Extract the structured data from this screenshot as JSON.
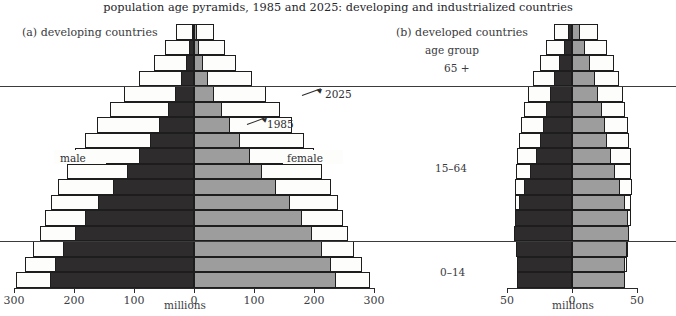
{
  "title": "population age pyramids, 1985 and 2025: developing and industrialized countries",
  "panels": {
    "left": {
      "label": "(a)  developing countries",
      "axis_caption": "millions",
      "ticks": [
        "300",
        "200",
        "100",
        "0",
        "100",
        "200",
        "300"
      ],
      "male_label": "male",
      "female_label": "female",
      "annotations": {
        "future": "2025",
        "past": "1985"
      }
    },
    "right": {
      "label": "(b)  developed countries",
      "age_group_caption": "age group",
      "axis_caption": "millions",
      "ticks": [
        "50",
        "0",
        "50"
      ],
      "age_groups": [
        "65 +",
        "15–64",
        "0–14"
      ]
    }
  },
  "colors": {
    "bar_1985_male": "#2e2c2d",
    "bar_1985_female": "#9d9d9d",
    "bar_2025_outline": "#fdfdfb",
    "ink": "#1d1d1d"
  },
  "chart_data": {
    "type": "bar",
    "title": "population age pyramids, 1985 and 2025: developing and industrialized countries",
    "xlabel": "millions",
    "ylabel": "age group",
    "grid": false,
    "legend_position": "in-plot annotations",
    "age_bands": [
      "80+",
      "75–79",
      "70–74",
      "65–69",
      "60–64",
      "55–59",
      "50–54",
      "45–49",
      "40–44",
      "35–39",
      "30–34",
      "25–29",
      "20–24",
      "15–19",
      "10–14",
      "5–9",
      "0–4"
    ],
    "age_group_dividers": [
      "65 +",
      "15–64",
      "0–14"
    ],
    "panels": [
      {
        "name": "developing countries",
        "xlim": [
          -300,
          300
        ],
        "xticks": [
          -300,
          -200,
          -100,
          0,
          100,
          200,
          300
        ],
        "series": [
          {
            "name": "male 1985",
            "side": "left",
            "year": 1985,
            "values": [
              4,
              8,
              14,
              22,
              32,
              44,
              58,
              74,
              92,
              112,
              135,
              160,
              182,
              198,
              218,
              232,
              240
            ]
          },
          {
            "name": "female 1985",
            "side": "right",
            "year": 1985,
            "values": [
              5,
              9,
              15,
              24,
              34,
              46,
              60,
              76,
              94,
              114,
              136,
              160,
              180,
              196,
              214,
              228,
              236
            ]
          },
          {
            "name": "male 2025",
            "side": "left",
            "year": 2025,
            "values": [
              30,
              48,
              66,
              92,
              116,
              140,
              162,
              182,
              198,
              212,
              226,
              238,
              248,
              256,
              268,
              282,
              296
            ]
          },
          {
            "name": "female 2025",
            "side": "right",
            "year": 2025,
            "values": [
              34,
              52,
              70,
              96,
              120,
              144,
              164,
              184,
              200,
              214,
              228,
              240,
              248,
              256,
              266,
              280,
              294
            ]
          }
        ]
      },
      {
        "name": "developed countries",
        "xlim": [
          -50,
          50
        ],
        "xticks": [
          -50,
          0,
          50
        ],
        "series": [
          {
            "name": "male 1985",
            "side": "left",
            "year": 1985,
            "values": [
              3,
              6,
              10,
              14,
              17,
              20,
              22,
              25,
              28,
              32,
              37,
              41,
              44,
              45,
              43,
              42,
              42
            ]
          },
          {
            "name": "female 1985",
            "side": "right",
            "year": 1985,
            "values": [
              6,
              10,
              14,
              18,
              20,
              23,
              25,
              27,
              30,
              33,
              37,
              41,
              43,
              44,
              42,
              41,
              41
            ]
          },
          {
            "name": "male 2025",
            "side": "left",
            "year": 2025,
            "values": [
              14,
              20,
              25,
              30,
              34,
              37,
              39,
              41,
              42,
              43,
              44,
              44,
              44,
              44,
              43,
              42,
              42
            ]
          },
          {
            "name": "female 2025",
            "side": "right",
            "year": 2025,
            "values": [
              20,
              27,
              32,
              36,
              39,
              41,
              43,
              44,
              45,
              45,
              46,
              45,
              45,
              44,
              43,
              42,
              41
            ]
          }
        ]
      }
    ]
  }
}
